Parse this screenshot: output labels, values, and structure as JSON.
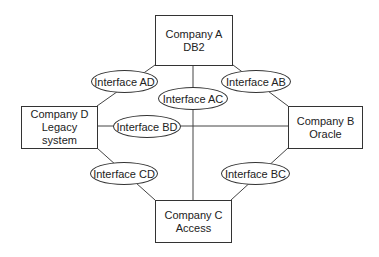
{
  "diagram": {
    "nodes": [
      {
        "id": "A",
        "line1": "Company A",
        "line2": "DB2"
      },
      {
        "id": "B",
        "line1": "Company B",
        "line2": "Oracle"
      },
      {
        "id": "C",
        "line1": "Company C",
        "line2": "Access"
      },
      {
        "id": "D",
        "line1": "Company D",
        "line2": "Legacy",
        "line3": "system"
      }
    ],
    "interfaces": [
      {
        "id": "AD",
        "label": "Interface AD"
      },
      {
        "id": "AB",
        "label": "Interface AB"
      },
      {
        "id": "AC",
        "label": "Interface AC"
      },
      {
        "id": "BD",
        "label": "Interface BD"
      },
      {
        "id": "CD",
        "label": "Interface CD"
      },
      {
        "id": "BC",
        "label": "Interface BC"
      }
    ],
    "colors": {
      "stroke": "#333333",
      "background": "#ffffff",
      "text": "#222222"
    }
  }
}
